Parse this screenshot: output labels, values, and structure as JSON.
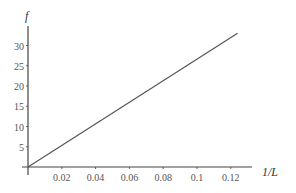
{
  "chart_data": {
    "type": "line",
    "title": "",
    "xlabel": "1/L",
    "ylabel": "f",
    "xlim": [
      0,
      0.13
    ],
    "ylim": [
      0,
      35
    ],
    "x_ticks": [
      "0.02",
      "0.04",
      "0.06",
      "0.08",
      "0.1",
      "0.12"
    ],
    "y_ticks": [
      "5",
      "10",
      "15",
      "20",
      "25",
      "30"
    ],
    "grid": false,
    "legend": null,
    "series": [
      {
        "name": "f vs 1/L",
        "x": [
          0,
          0.124
        ],
        "y": [
          0,
          33
        ]
      }
    ]
  }
}
